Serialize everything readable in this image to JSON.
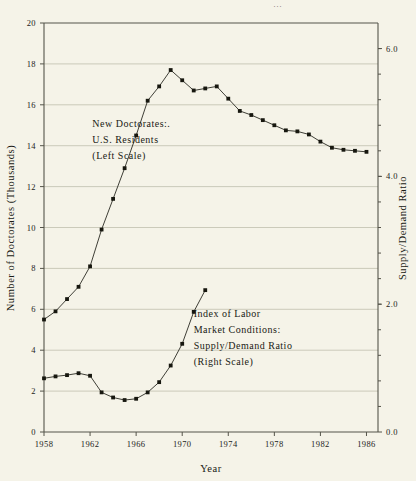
{
  "chart_data": {
    "type": "line",
    "title": "",
    "xlabel": "Year",
    "ylabel": "Number of Doctorates (Thousands)",
    "y2label": "Supply/Demand Ratio",
    "xlim": [
      1958,
      1987
    ],
    "ylim": [
      0,
      20
    ],
    "y2lim": [
      0.0,
      6.4
    ],
    "grid": true,
    "legend_position": "inline-annotation",
    "x_ticks": [
      "1958",
      "1962",
      "1966",
      "1970",
      "1974",
      "1978",
      "1982",
      "1986"
    ],
    "x_tick_values": [
      1958,
      1962,
      1966,
      1970,
      1974,
      1978,
      1982,
      1986
    ],
    "y_ticks": [
      "0",
      "2",
      "4",
      "6",
      "8",
      "10",
      "12",
      "14",
      "16",
      "18",
      "20"
    ],
    "y_tick_values": [
      0,
      2,
      4,
      6,
      8,
      10,
      12,
      14,
      16,
      18,
      20
    ],
    "y2_ticks": [
      "0.0",
      "2.0",
      "4.0",
      "6.0"
    ],
    "y2_tick_values": [
      0.0,
      2.0,
      4.0,
      6.0
    ],
    "series": [
      {
        "name": "New Doctorates: U.S. Residents",
        "axis": "left",
        "units": "thousands",
        "x": [
          1958,
          1959,
          1960,
          1961,
          1962,
          1963,
          1964,
          1965,
          1966,
          1967,
          1968,
          1969,
          1970,
          1971,
          1972,
          1973,
          1974,
          1975,
          1976,
          1977,
          1978,
          1979,
          1980,
          1981,
          1982,
          1983,
          1984,
          1985,
          1986
        ],
        "values": [
          5.5,
          5.9,
          6.5,
          7.1,
          8.1,
          9.9,
          11.4,
          12.9,
          14.5,
          16.2,
          16.9,
          17.7,
          17.2,
          16.7,
          16.8,
          16.9,
          16.3,
          15.7,
          15.5,
          15.25,
          15.0,
          14.75,
          14.7,
          14.55,
          14.2,
          13.9,
          13.8,
          13.75,
          13.7
        ]
      },
      {
        "name": "Index of Labor Market Conditions: Supply/Demand Ratio",
        "axis": "right",
        "x": [
          1958,
          1959,
          1960,
          1961,
          1962,
          1963,
          1964,
          1965,
          1966,
          1967,
          1968,
          1969,
          1970,
          1971,
          1972
        ],
        "values": [
          0.84,
          0.87,
          0.89,
          0.92,
          0.88,
          0.62,
          0.54,
          0.5,
          0.52,
          0.62,
          0.78,
          1.04,
          1.38,
          1.88,
          2.22
        ],
        "values_left_scale": [
          2.6,
          2.7,
          2.8,
          2.9,
          2.75,
          1.95,
          1.7,
          1.55,
          1.62,
          1.95,
          2.45,
          3.25,
          4.3,
          5.9,
          6.95
        ]
      }
    ],
    "annotations": [
      {
        "id": "annotation-doctorates",
        "lines": [
          "New Doctorates:.",
          "U.S. Residents",
          "(Left Scale)"
        ],
        "x": 1962.2,
        "y_left": 14.9
      },
      {
        "id": "annotation-supply-demand",
        "lines": [
          "Index of Labor",
          "Market Conditions:",
          "Supply/Demand Ratio",
          "(Right Scale)"
        ],
        "x": 1971.0,
        "y_left": 5.6
      }
    ],
    "top_fragment": "..."
  }
}
